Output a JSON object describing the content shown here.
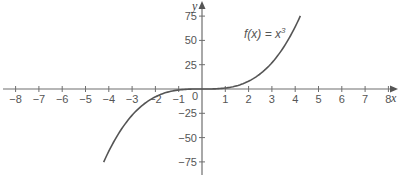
{
  "chart_data": {
    "type": "line",
    "title": "",
    "xlabel": "x",
    "ylabel": "y",
    "xlim": [
      -8.5,
      8.5
    ],
    "ylim": [
      -80,
      80
    ],
    "grid": false,
    "legend": "none",
    "x_ticks": [
      -8,
      -7,
      -6,
      -5,
      -4,
      -3,
      -2,
      -1,
      1,
      2,
      3,
      4,
      5,
      6,
      7,
      8
    ],
    "x_tick_labels": [
      "−8",
      "−7",
      "−6",
      "−5",
      "−4",
      "−3",
      "−2",
      "−1",
      "1",
      "2",
      "3",
      "4",
      "5",
      "6",
      "7",
      "8"
    ],
    "y_ticks": [
      75,
      50,
      25,
      -25,
      -50,
      -75
    ],
    "y_tick_labels": [
      "75",
      "50",
      "25",
      "−25",
      "−50",
      "−75"
    ],
    "origin_label": "0",
    "series": [
      {
        "name": "f(x) = x^3",
        "function": "x^3",
        "x_range": [
          -4.22,
          4.22
        ],
        "x": [
          -4.2,
          -4,
          -3.5,
          -3,
          -2.5,
          -2,
          -1.5,
          -1,
          -0.5,
          0,
          0.5,
          1,
          1.5,
          2,
          2.5,
          3,
          3.5,
          4,
          4.2
        ],
        "y": [
          -74.1,
          -64,
          -42.9,
          -27,
          -15.6,
          -8,
          -3.4,
          -1,
          -0.1,
          0,
          0.1,
          1,
          3.4,
          8,
          15.6,
          27,
          42.9,
          64,
          74.1
        ]
      }
    ],
    "annotations": [
      {
        "text": "f(x) = x³",
        "x": 1.8,
        "y": 57
      }
    ]
  },
  "labels": {
    "x_axis": "x",
    "y_axis": "y",
    "origin": "0",
    "function_prefix": "f(x) = x",
    "function_exponent": "3"
  },
  "colors": {
    "axis": "#6e6e6e",
    "curve": "#555555",
    "text": "#555555"
  }
}
